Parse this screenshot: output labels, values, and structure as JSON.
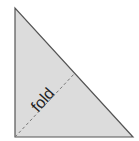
{
  "diagram": {
    "label": "fold",
    "colors": {
      "fill": "#dcdcdc",
      "stroke": "#555555",
      "fold_line": "#777777",
      "text": "#222222"
    }
  }
}
